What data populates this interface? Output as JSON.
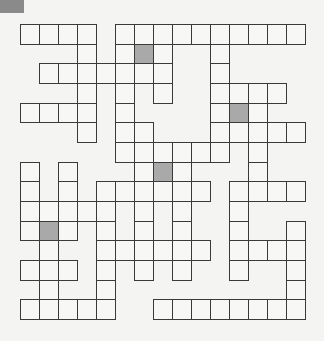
{
  "puzzle": {
    "type": "crossword-grid",
    "cols": 15,
    "rows": 15,
    "cell_width": 19,
    "cell_height": 19.67,
    "colors": {
      "border": "#3a3a3a",
      "cell": "#f7f7f5",
      "shaded": "#a9a9a9",
      "background": "#f4f4f2",
      "corner_tab": "#8a8a8a"
    },
    "grid": [
      {
        "row": 0,
        "cells": [
          0,
          1,
          2,
          3,
          5,
          6,
          7,
          8,
          9,
          10,
          11,
          12,
          13,
          14
        ],
        "shaded": []
      },
      {
        "row": 1,
        "cells": [
          3,
          5,
          6,
          7,
          10
        ],
        "shaded": [
          6
        ]
      },
      {
        "row": 2,
        "cells": [
          1,
          2,
          3,
          4,
          5,
          6,
          7,
          10
        ],
        "shaded": []
      },
      {
        "row": 3,
        "cells": [
          3,
          5,
          7,
          10,
          11,
          12,
          13
        ],
        "shaded": []
      },
      {
        "row": 4,
        "cells": [
          0,
          1,
          2,
          3,
          5,
          10,
          11,
          12
        ],
        "shaded": [
          11
        ]
      },
      {
        "row": 5,
        "cells": [
          3,
          5,
          6,
          10,
          11,
          12,
          13,
          14
        ],
        "shaded": []
      },
      {
        "row": 6,
        "cells": [
          5,
          6,
          7,
          8,
          9,
          10,
          12
        ],
        "shaded": []
      },
      {
        "row": 7,
        "cells": [
          0,
          2,
          6,
          7,
          8,
          12
        ],
        "shaded": [
          7
        ]
      },
      {
        "row": 8,
        "cells": [
          0,
          2,
          4,
          5,
          6,
          7,
          8,
          9,
          11,
          12,
          13,
          14
        ],
        "shaded": []
      },
      {
        "row": 9,
        "cells": [
          0,
          1,
          2,
          3,
          4,
          6,
          8,
          11
        ],
        "shaded": []
      },
      {
        "row": 10,
        "cells": [
          0,
          1,
          2,
          4,
          6,
          8,
          11,
          14
        ],
        "shaded": [
          1
        ]
      },
      {
        "row": 11,
        "cells": [
          1,
          4,
          5,
          6,
          7,
          8,
          9,
          11,
          12,
          13,
          14
        ],
        "shaded": []
      },
      {
        "row": 12,
        "cells": [
          0,
          1,
          2,
          4,
          6,
          8,
          11,
          14
        ],
        "shaded": []
      },
      {
        "row": 13,
        "cells": [
          1,
          4,
          14
        ],
        "shaded": []
      },
      {
        "row": 14,
        "cells": [
          0,
          1,
          2,
          3,
          4,
          7,
          8,
          9,
          10,
          11,
          12,
          13,
          14
        ],
        "shaded": []
      }
    ]
  }
}
